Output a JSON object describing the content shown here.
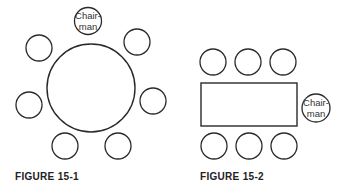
{
  "figures": [
    {
      "caption": "FIGURE 15-1",
      "table_shape": "round",
      "chair_label_line1": "Chair-",
      "chair_label_line2": "man"
    },
    {
      "caption": "FIGURE 15-2",
      "table_shape": "rectangular",
      "chair_label_line1": "Chair-",
      "chair_label_line2": "man"
    }
  ],
  "colors": {
    "stroke": "#2a2a2a",
    "background": "#ffffff",
    "text": "#222222"
  }
}
